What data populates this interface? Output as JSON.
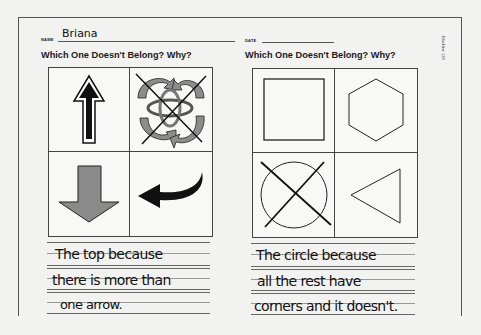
{
  "worksheet": {
    "name_label": "NAME",
    "name_value": "Briana",
    "date_label": "DATE",
    "date_value": "",
    "side_label": "Blackline 124"
  },
  "left_panel": {
    "title": "Which One Doesn't Belong? Why?",
    "cells": [
      {
        "position": "top-left",
        "icon": "black-up-arrow-icon",
        "crossed": false
      },
      {
        "position": "top-right",
        "icon": "swirling-gray-arrows-icon",
        "crossed": true
      },
      {
        "position": "bottom-left",
        "icon": "gray-down-arrow-icon",
        "crossed": false
      },
      {
        "position": "bottom-right",
        "icon": "black-curved-left-arrow-icon",
        "crossed": false
      }
    ],
    "answer_lines": [
      "The top because",
      "there is more than",
      "one arrow."
    ]
  },
  "right_panel": {
    "title": "Which One Doesn't Belong? Why?",
    "cells": [
      {
        "position": "top-left",
        "icon": "square-icon",
        "crossed": false
      },
      {
        "position": "top-right",
        "icon": "hexagon-icon",
        "crossed": false
      },
      {
        "position": "bottom-left",
        "icon": "circle-icon",
        "crossed": true
      },
      {
        "position": "bottom-right",
        "icon": "triangle-icon",
        "crossed": false
      }
    ],
    "answer_lines": [
      "The circle because",
      "all the rest have",
      "corners and it doesn't."
    ]
  },
  "colors": {
    "background": "#f2f2f1",
    "ink": "#111111",
    "arrow_gray": "#8a8a8a",
    "frame": "#555555"
  }
}
